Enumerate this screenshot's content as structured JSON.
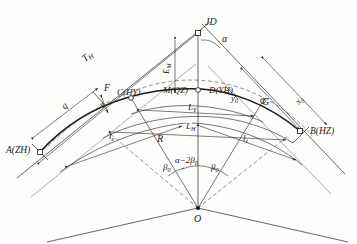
{
  "diagram": {
    "type": "highway-transition-curve-layout",
    "title": "",
    "points": {
      "jd": "JD",
      "a_zh": "A(ZH)",
      "b_hz": "B(HZ)",
      "c_hy": "C(HY)",
      "m_qz": "M(QZ)",
      "d_yh": "D(YH)",
      "o": "O",
      "f": "F"
    },
    "dimensions": {
      "tangent": "T",
      "tangent_sub": "H",
      "external": "E",
      "external_sub": "M",
      "curve_total": "L",
      "curve_total_sub": "H",
      "curve_circular": "L",
      "curve_circular_sub": "Y",
      "spiral_left": "l",
      "spiral_left_sub": "z",
      "spiral_right": "l",
      "spiral_right_sub": "z",
      "radius": "R",
      "shift_q": "q",
      "shift_p": "p",
      "offset_y0": "y",
      "offset_y0_sub": "0",
      "offset_x0": "x",
      "offset_x0_sub": "0",
      "chord_g": "G"
    },
    "angles": {
      "deflection": "α",
      "spiral_left": "β",
      "spiral_left_sub": "0",
      "spiral_right": "β",
      "spiral_right_sub": "0",
      "central": "α−2β",
      "central_sub": "0"
    },
    "colors": {
      "stroke": "#262626",
      "light_stroke": "#6b6b6b",
      "background": "#fdfdfc"
    }
  }
}
